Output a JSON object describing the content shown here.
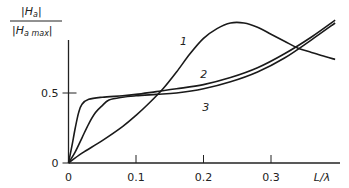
{
  "chart_data": {
    "type": "line",
    "title": "",
    "ylabel_numerator": "|H",
    "ylabel_numerator_sub": "a",
    "ylabel_denominator": "|H",
    "ylabel_denominator_sub": "a max",
    "xlabel": "L/λ",
    "xlim": [
      0,
      0.4
    ],
    "ylim": [
      0,
      1.05
    ],
    "x_ticks": [
      {
        "value": 0,
        "label": "0"
      },
      {
        "value": 0.1,
        "label": "0.1"
      },
      {
        "value": 0.2,
        "label": "0.2"
      },
      {
        "value": 0.3,
        "label": "0.3"
      }
    ],
    "y_ticks": [
      {
        "value": 0,
        "label": "0"
      },
      {
        "value": 0.5,
        "label": "0.5"
      }
    ],
    "grid": false,
    "series": [
      {
        "name": "1",
        "label_at": [
          0.165,
          0.84
        ],
        "points": [
          [
            0,
            0
          ],
          [
            0.02,
            0.07
          ],
          [
            0.05,
            0.16
          ],
          [
            0.08,
            0.26
          ],
          [
            0.1,
            0.34
          ],
          [
            0.12,
            0.43
          ],
          [
            0.14,
            0.53
          ],
          [
            0.16,
            0.65
          ],
          [
            0.18,
            0.78
          ],
          [
            0.2,
            0.89
          ],
          [
            0.22,
            0.96
          ],
          [
            0.24,
            1.0
          ],
          [
            0.26,
            1.0
          ],
          [
            0.28,
            0.97
          ],
          [
            0.3,
            0.92
          ],
          [
            0.32,
            0.87
          ],
          [
            0.34,
            0.82
          ],
          [
            0.36,
            0.79
          ],
          [
            0.38,
            0.76
          ],
          [
            0.395,
            0.74
          ]
        ]
      },
      {
        "name": "2",
        "label_at": [
          0.195,
          0.61
        ],
        "points": [
          [
            0,
            0
          ],
          [
            0.005,
            0.12
          ],
          [
            0.01,
            0.25
          ],
          [
            0.015,
            0.36
          ],
          [
            0.02,
            0.42
          ],
          [
            0.03,
            0.455
          ],
          [
            0.05,
            0.47
          ],
          [
            0.08,
            0.48
          ],
          [
            0.1,
            0.49
          ],
          [
            0.13,
            0.51
          ],
          [
            0.16,
            0.53
          ],
          [
            0.2,
            0.56
          ],
          [
            0.24,
            0.61
          ],
          [
            0.28,
            0.68
          ],
          [
            0.32,
            0.78
          ],
          [
            0.36,
            0.9
          ],
          [
            0.395,
            1.02
          ]
        ]
      },
      {
        "name": "3",
        "label_at": [
          0.198,
          0.37
        ],
        "points": [
          [
            0,
            0
          ],
          [
            0.01,
            0.08
          ],
          [
            0.02,
            0.18
          ],
          [
            0.03,
            0.28
          ],
          [
            0.04,
            0.36
          ],
          [
            0.05,
            0.41
          ],
          [
            0.06,
            0.45
          ],
          [
            0.08,
            0.47
          ],
          [
            0.1,
            0.48
          ],
          [
            0.13,
            0.49
          ],
          [
            0.16,
            0.5
          ],
          [
            0.2,
            0.53
          ],
          [
            0.24,
            0.58
          ],
          [
            0.28,
            0.65
          ],
          [
            0.32,
            0.75
          ],
          [
            0.36,
            0.88
          ],
          [
            0.395,
            1.0
          ]
        ]
      }
    ]
  }
}
